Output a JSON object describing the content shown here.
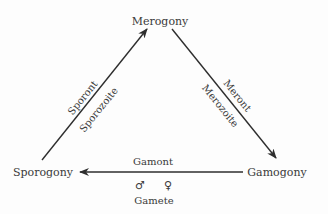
{
  "diagram": {
    "nodes": {
      "top": "Merogony",
      "right": "Gamogony",
      "left": "Sporogony"
    },
    "edges": {
      "left_side": {
        "from": "Sporogony",
        "to": "Merogony",
        "label_outer": "Sporont",
        "label_inner": "Sporozoite"
      },
      "right_side": {
        "from": "Merogony",
        "to": "Gamogony",
        "label_outer": "Meront",
        "label_inner": "Merozoite"
      },
      "bottom": {
        "from": "Gamogony",
        "to": "Sporogony",
        "label_above": "Gamont",
        "male_symbol": "♂",
        "female_symbol": "♀",
        "label_below": "Gamete"
      }
    },
    "colors": {
      "arrow": "#2e2e2e",
      "text": "#3a3a3a",
      "background": "#fdfdfd"
    }
  }
}
